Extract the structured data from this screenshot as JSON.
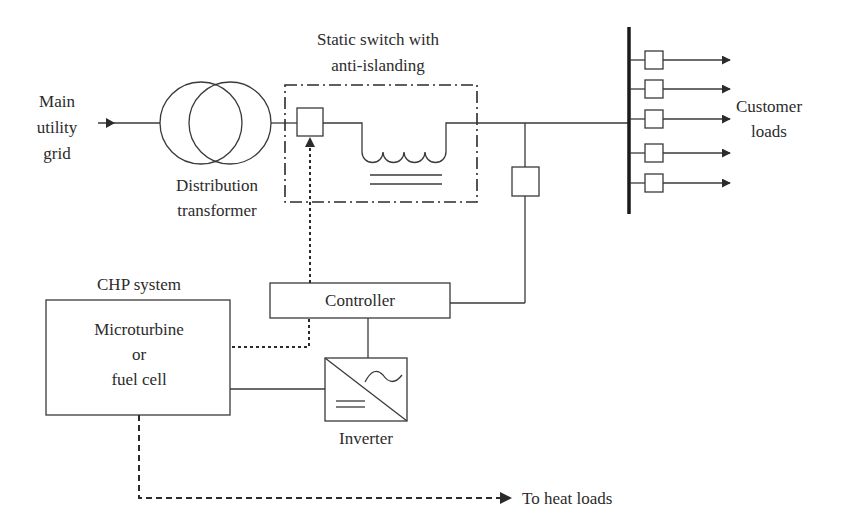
{
  "diagram": {
    "nodes": {
      "grid": {
        "lines": [
          "Main",
          "utility",
          "grid"
        ]
      },
      "transformer": {
        "lines": [
          "Distribution",
          "transformer"
        ]
      },
      "static_switch": {
        "lines": [
          "Static switch with",
          "anti-islanding"
        ]
      },
      "customer_loads": {
        "lines": [
          "Customer",
          "loads"
        ],
        "count": 5
      },
      "chp": {
        "title": "CHP system",
        "lines": [
          "Microturbine",
          "or",
          "fuel cell"
        ]
      },
      "controller": {
        "label": "Controller"
      },
      "inverter": {
        "label": "Inverter"
      },
      "heat_loads": {
        "label": "To heat loads"
      }
    },
    "edges": [
      {
        "from": "grid",
        "to": "transformer",
        "style": "solid-arrow"
      },
      {
        "from": "transformer",
        "to": "static_switch",
        "style": "solid"
      },
      {
        "from": "static_switch",
        "to": "customer_bus",
        "style": "solid"
      },
      {
        "from": "customer_bus",
        "to": "customer_loads",
        "style": "solid-arrow"
      },
      {
        "from": "feeder_breaker",
        "to": "controller",
        "style": "solid"
      },
      {
        "from": "controller",
        "to": "static_switch",
        "style": "dotted-arrow"
      },
      {
        "from": "chp",
        "to": "controller",
        "style": "dotted"
      },
      {
        "from": "controller",
        "to": "inverter",
        "style": "solid"
      },
      {
        "from": "chp",
        "to": "inverter",
        "style": "solid"
      },
      {
        "from": "chp",
        "to": "heat_loads",
        "style": "dashed-arrow"
      }
    ]
  }
}
